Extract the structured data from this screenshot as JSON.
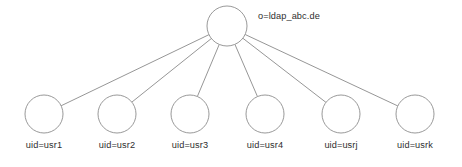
{
  "diagram": {
    "type": "ldap-directory-tree",
    "background_color": "#ffffff",
    "node_stroke_color": "#8d8d8d",
    "node_fill_color": "#ffffff",
    "edge_color": "#8a8a8a",
    "label_color": "#2e2e2e",
    "root": {
      "label": "o=ldap_abc.de",
      "cx": 227,
      "cy": 26,
      "r": 20,
      "label_x": 258,
      "label_y": 19
    },
    "leaves": [
      {
        "label": "uid=usr1",
        "cx": 44,
        "cy": 114,
        "r": 19,
        "label_y": 148
      },
      {
        "label": "uid=usr2",
        "cx": 117,
        "cy": 114,
        "r": 19,
        "label_y": 148
      },
      {
        "label": "uid=usr3",
        "cx": 190,
        "cy": 114,
        "r": 19,
        "label_y": 148
      },
      {
        "label": "uid=usr4",
        "cx": 265,
        "cy": 114,
        "r": 19,
        "label_y": 148
      },
      {
        "label": "uid=usrj",
        "cx": 341,
        "cy": 114,
        "r": 19,
        "label_y": 148
      },
      {
        "label": "uid=usrk",
        "cx": 415,
        "cy": 114,
        "r": 19,
        "label_y": 148
      }
    ]
  }
}
